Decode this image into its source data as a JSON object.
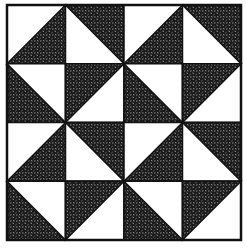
{
  "diagram": {
    "type": "quilt-block",
    "grid": {
      "rows": 4,
      "cols": 4
    },
    "bounds": {
      "x": 7,
      "y": 5,
      "width": 234,
      "height": 235
    },
    "colors": {
      "background": "#ffffff",
      "dark": "#1a1a1a",
      "line": "#111111",
      "speckle": "#ffffff"
    },
    "cells": [
      [
        {
          "diagonal": "anti",
          "dark": "bottom-right"
        },
        {
          "diagonal": "anti",
          "dark": "top-left-flip"
        },
        {
          "diagonal": "anti",
          "dark": "bottom-right"
        },
        {
          "diagonal": "anti",
          "dark": "top-left-flip"
        }
      ],
      [
        {
          "diagonal": "main",
          "dark": "bottom-left"
        },
        {
          "diagonal": "main",
          "dark": "top-right-flip"
        },
        {
          "diagonal": "main",
          "dark": "bottom-left"
        },
        {
          "diagonal": "main",
          "dark": "top-right-flip"
        }
      ],
      [
        {
          "diagonal": "anti",
          "dark": "bottom-right"
        },
        {
          "diagonal": "anti",
          "dark": "top-left-flip"
        },
        {
          "diagonal": "anti",
          "dark": "bottom-right"
        },
        {
          "diagonal": "anti",
          "dark": "top-left-flip"
        }
      ],
      [
        {
          "diagonal": "main",
          "dark": "bottom-left"
        },
        {
          "diagonal": "main",
          "dark": "top-right-flip"
        },
        {
          "diagonal": "main",
          "dark": "bottom-left"
        },
        {
          "diagonal": "main",
          "dark": "top-right-flip"
        }
      ]
    ]
  }
}
